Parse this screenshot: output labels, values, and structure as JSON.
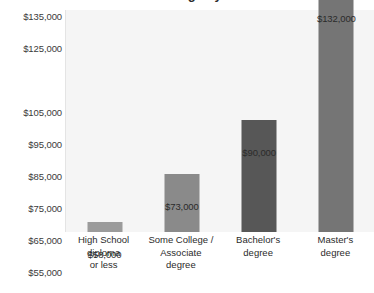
{
  "chart_data": {
    "type": "bar",
    "title": "Median annual earnings by education level",
    "title_visibility": "cropped at top edge of image",
    "xlabel": "",
    "ylabel": "",
    "grid": false,
    "legend": "none",
    "orientation": "vertical",
    "ylim": [
      55000,
      138000
    ],
    "baseline": 55000,
    "categories": [
      "High School diploma or less",
      "Some College / Associate degree",
      "Bachelor's degree",
      "Master's degree"
    ],
    "category_lines": [
      [
        "High School",
        "diploma",
        "or less"
      ],
      [
        "Some College /",
        "Associate",
        "degree"
      ],
      [
        "Bachelor's",
        "degree"
      ],
      [
        "Master's",
        "degree"
      ]
    ],
    "values": [
      58000,
      73000,
      90000,
      132000
    ],
    "value_labels": [
      "$58,000",
      "$73,000",
      "$90,000",
      "$132,000"
    ],
    "bar_colors": [
      "#9b9b9b",
      "#8a8a8a",
      "#575757",
      "#757575"
    ],
    "ytick_labels": [
      "$135,000",
      "$125,000",
      "$105,000",
      "$95,000",
      "$85,000",
      "$75,000",
      "$65,000",
      "$55,000"
    ],
    "ytick_values": [
      135000,
      125000,
      105000,
      95000,
      85000,
      75000,
      65000,
      55000
    ],
    "ytick_note": "$115,000 label is absent between $125,000 and $105,000 in the source chart",
    "plot_background": "#f5f5f5"
  }
}
